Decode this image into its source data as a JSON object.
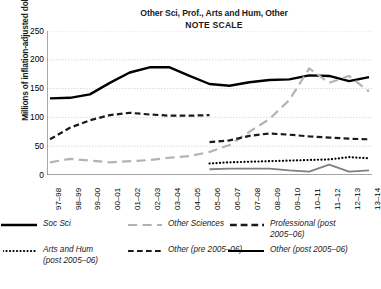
{
  "chart_data": {
    "type": "line",
    "title": "Other Sci, Prof., Arts and Hum, Other",
    "subtitle": "NOTE SCALE",
    "xlabel": "",
    "ylabel": "Millions of inflation-adjusted dollars",
    "ylim": [
      0,
      250
    ],
    "yticks": [
      0,
      50,
      100,
      150,
      200,
      250
    ],
    "grid": true,
    "legend_position": "bottom",
    "categories": [
      "97–98",
      "98–99",
      "99–00",
      "00–01",
      "01–02",
      "02–03",
      "03–04",
      "04–05",
      "05–06",
      "06–07",
      "07–08",
      "08–09",
      "09–10",
      "10–11",
      "11–12",
      "12–13",
      "13–14"
    ],
    "series": [
      {
        "name": "Soc Sci",
        "style": "solid",
        "color": "#000000",
        "width": 2.4,
        "values": [
          133,
          134,
          140,
          160,
          178,
          187,
          187,
          172,
          158,
          155,
          161,
          165,
          166,
          173,
          172,
          163,
          170
        ]
      },
      {
        "name": "Other Sciences",
        "style": "longdash",
        "color": "#b3b3b3",
        "width": 2.2,
        "values": [
          22,
          28,
          25,
          22,
          24,
          26,
          30,
          33,
          40,
          52,
          75,
          97,
          130,
          185,
          160,
          172,
          145
        ]
      },
      {
        "name": "Professional (post 2005–06)",
        "style": "dash",
        "color": "#1a1a1a",
        "width": 2.2,
        "values": [
          null,
          null,
          null,
          null,
          null,
          null,
          null,
          null,
          57,
          60,
          68,
          72,
          70,
          67,
          65,
          63,
          62
        ]
      },
      {
        "name": "Arts and Hum (post 2005–06)",
        "style": "dot",
        "color": "#000000",
        "width": 2.2,
        "values": [
          null,
          null,
          null,
          null,
          null,
          null,
          null,
          null,
          20,
          22,
          23,
          24,
          25,
          26,
          27,
          31,
          29
        ]
      },
      {
        "name": "Other (pre 2005–06)",
        "style": "dash",
        "color": "#1a1a1a",
        "width": 2.2,
        "values": [
          62,
          82,
          95,
          104,
          108,
          105,
          103,
          103,
          104,
          null,
          null,
          null,
          null,
          null,
          null,
          null,
          null
        ]
      },
      {
        "name": "Other (post 2005–06)",
        "style": "solid",
        "color": "#808080",
        "width": 1.8,
        "values": [
          null,
          null,
          null,
          null,
          null,
          null,
          null,
          null,
          10,
          11,
          11,
          11,
          8,
          6,
          18,
          6,
          8
        ]
      }
    ]
  },
  "legend": {
    "items": [
      {
        "label": "Soc Sci",
        "label2": "",
        "key": "soc-sci"
      },
      {
        "label": "Other Sciences",
        "label2": "",
        "key": "other-sciences"
      },
      {
        "label": "Professional (post",
        "label2": "2005–06)",
        "key": "professional"
      },
      {
        "label": "Arts and Hum",
        "label2": "(post  2005–06)",
        "key": "arts-and-hum"
      },
      {
        "label": "Other (pre 2005–06)",
        "label2": "",
        "key": "other-pre"
      },
      {
        "label": "Other (post 2005–06)",
        "label2": "",
        "key": "other-post"
      }
    ]
  }
}
